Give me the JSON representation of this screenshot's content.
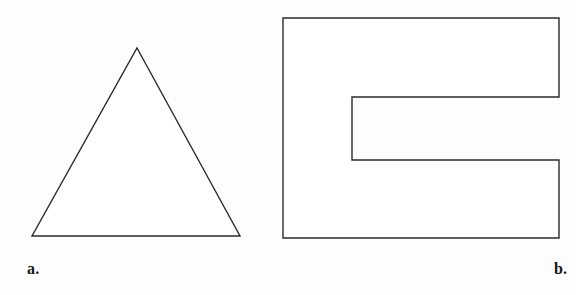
{
  "page": {
    "background_color": "#fdfdfd",
    "width": 576,
    "height": 295
  },
  "style": {
    "stroke_color": "#2b2b2b",
    "fill_color": "#ffffff",
    "stroke_width": 1.4
  },
  "figures": [
    {
      "id": "figure-a",
      "label": "a.",
      "shape_name": "triangle",
      "description": "Isosceles triangle outline",
      "vertices": [
        [
          137,
          48
        ],
        [
          240,
          236
        ],
        [
          32,
          236
        ]
      ],
      "points_string": "137,48 240,236 32,236",
      "viewbox": "0 0 288 295",
      "bounds": {
        "x": 32,
        "y": 48,
        "width": 208,
        "height": 188
      }
    },
    {
      "id": "figure-b",
      "label": "b.",
      "shape_name": "c-block-polygon",
      "description": "C-shaped rectilinear polygon with a rectangular notch opening to the right",
      "vertices": [
        [
          11,
          18
        ],
        [
          287,
          18
        ],
        [
          287,
          97
        ],
        [
          80,
          97
        ],
        [
          80,
          160
        ],
        [
          287,
          160
        ],
        [
          287,
          238
        ],
        [
          11,
          238
        ]
      ],
      "points_string": "11,18 287,18 287,97 80,97 80,160 287,160 287,238 11,238",
      "viewbox": "0 0 304 295",
      "bounds": {
        "x": 283,
        "y": 18,
        "width": 276,
        "height": 220
      },
      "notch": {
        "x": 352,
        "y": 97,
        "width": 207,
        "height": 63
      }
    }
  ]
}
